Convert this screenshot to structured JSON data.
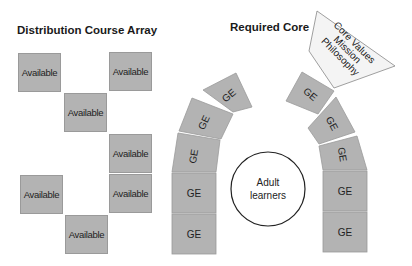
{
  "left_section": {
    "title": "Distribution Course Array",
    "boxes": [
      {
        "label": "Available"
      },
      {
        "label": "Available"
      },
      {
        "label": "Available"
      },
      {
        "label": "Available"
      },
      {
        "label": "Available"
      },
      {
        "label": "Available"
      },
      {
        "label": "Available"
      }
    ]
  },
  "right_section": {
    "title": "Required Core",
    "left_arch": [
      {
        "label": "GE"
      },
      {
        "label": "GE"
      },
      {
        "label": "GE"
      },
      {
        "label": "GE"
      },
      {
        "label": "GE"
      }
    ],
    "right_arch": [
      {
        "label": "GE"
      },
      {
        "label": "GE"
      },
      {
        "label": "GE"
      },
      {
        "label": "GE"
      },
      {
        "label": "GE"
      }
    ],
    "center_circle": {
      "line1": "Adult",
      "line2": "learners"
    },
    "funnel": {
      "line1": "Core Values",
      "line2": "Mission",
      "line3": "Philosophy"
    }
  },
  "colors": {
    "block_fill": "#b3b3b3",
    "funnel_fill": "#f4f4f4"
  }
}
